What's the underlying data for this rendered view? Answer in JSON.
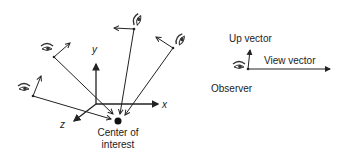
{
  "diagram": {
    "left": {
      "axes": {
        "x_label": "x",
        "y_label": "y",
        "z_label": "z"
      },
      "center_label_line1": "Center of",
      "center_label_line2": "interest",
      "observers": 4
    },
    "right": {
      "up_vector_label": "Up vector",
      "view_vector_label": "View vector",
      "observer_label": "Observer"
    },
    "colors": {
      "line": "#222222",
      "background": "#ffffff"
    }
  }
}
